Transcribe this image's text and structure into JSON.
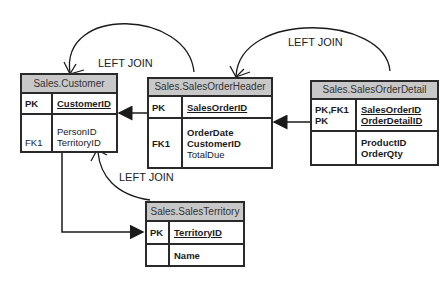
{
  "joins": [
    {
      "label": "LEFT JOIN",
      "from": "Sales.SalesOrderHeader",
      "to": "Sales.Customer"
    },
    {
      "label": "LEFT JOIN",
      "from": "Sales.SalesOrderDetail",
      "to": "Sales.SalesOrderHeader"
    },
    {
      "label": "LEFT JOIN",
      "from": "Sales.SalesTerritory",
      "to": "Sales.Customer"
    }
  ],
  "entities": {
    "customer": {
      "title": "Sales.Customer",
      "pk_key": "PK",
      "pk_cols": [
        "CustomerID"
      ],
      "rest_keys": [
        "",
        "FK1"
      ],
      "rest_cols": [
        "PersonID",
        "TerritoryID"
      ]
    },
    "order_header": {
      "title": "Sales.SalesOrderHeader",
      "pk_key": "PK",
      "pk_cols": [
        "SalesOrderID"
      ],
      "rest_keys": [
        "",
        "FK1",
        ""
      ],
      "rest_cols": [
        "OrderDate",
        "CustomerID",
        "TotalDue"
      ]
    },
    "order_detail": {
      "title": "Sales.SalesOrderDetail",
      "pk_keys": [
        "PK,FK1",
        "PK"
      ],
      "pk_cols": [
        "SalesOrderID",
        "OrderDetailID"
      ],
      "rest_cols": [
        "ProductID",
        "OrderQty"
      ]
    },
    "territory": {
      "title": "Sales.SalesTerritory",
      "pk_key": "PK",
      "pk_cols": [
        "TerritoryID"
      ],
      "rest_cols": [
        "Name"
      ]
    }
  }
}
